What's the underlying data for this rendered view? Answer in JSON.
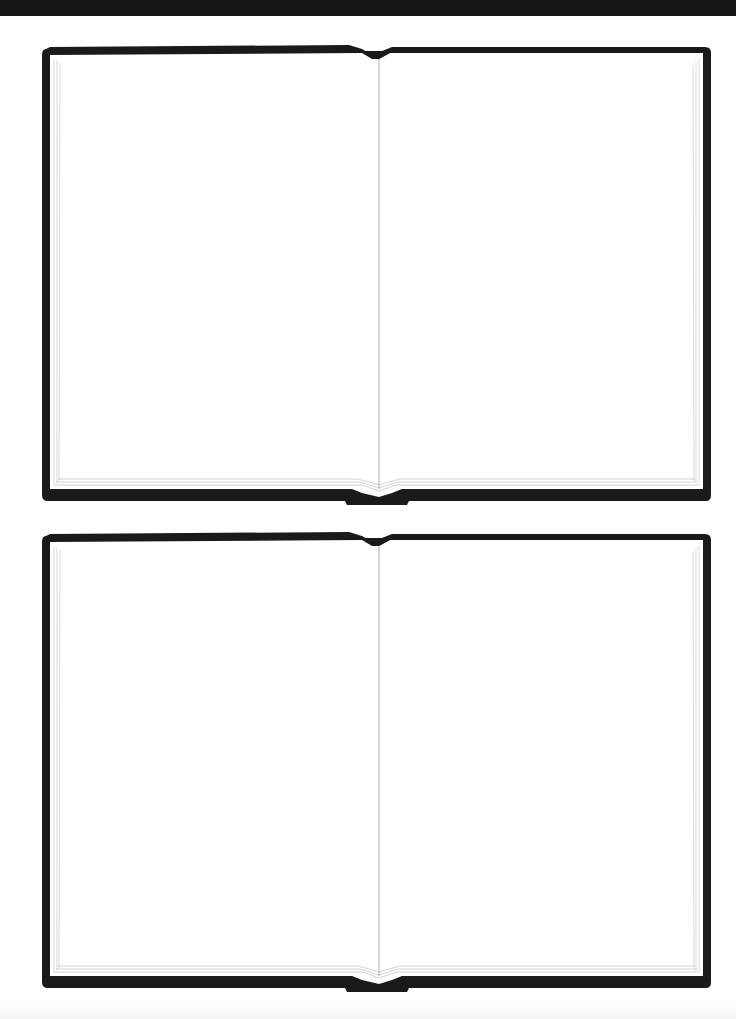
{
  "page": {
    "background": "#ffffff",
    "top_band_color": "#141414",
    "frame_color": "#1a1a1a",
    "page_edge_color": "#c8c8c8",
    "spine_color": "#9a9a9a"
  },
  "books": [
    {
      "id": "book-1",
      "left_page": {
        "text": ""
      },
      "right_page": {
        "text": ""
      }
    },
    {
      "id": "book-2",
      "left_page": {
        "text": ""
      },
      "right_page": {
        "text": ""
      }
    }
  ]
}
